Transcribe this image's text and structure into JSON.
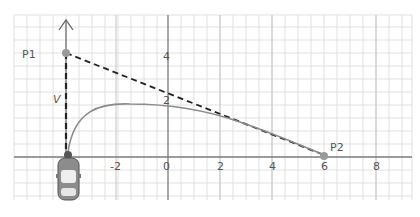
{
  "diagram": {
    "type": "trajectory-on-grid",
    "points": [
      {
        "id": "p1",
        "label": "P1",
        "x": -4,
        "y": 4
      },
      {
        "id": "p2",
        "label": "P2",
        "x": 6,
        "y": 0
      },
      {
        "id": "origin-car",
        "label": "",
        "x": -4,
        "y": 0
      }
    ],
    "velocity_label": "V",
    "x_ticks": [
      "-2",
      "0",
      "2",
      "4",
      "6",
      "8"
    ],
    "y_ticks": [
      "2",
      "4"
    ],
    "colors": {
      "grid": "#d6d6d6",
      "axis": "#777777",
      "curve": "#8a8a8a",
      "dashed": "#222222",
      "point": "#888888"
    }
  }
}
